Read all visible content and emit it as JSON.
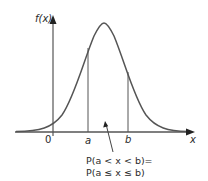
{
  "diagram": {
    "type": "normal-distribution-probability",
    "y_axis_label": "f(x)",
    "x_axis_label": "x",
    "origin_label": "0",
    "lower_bound_label": "a",
    "upper_bound_label": "b",
    "annotation_line1": "P(a < x < b)=",
    "annotation_line2": "P(a ≤ x ≤ b)",
    "colors": {
      "axis": "#555555",
      "curve": "#555555",
      "text": "#2a2a2a",
      "background": "#ffffff"
    }
  }
}
